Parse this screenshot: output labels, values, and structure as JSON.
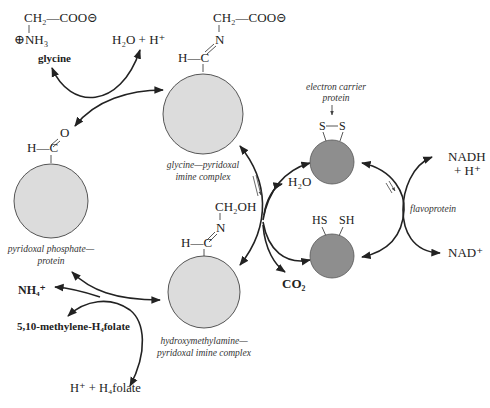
{
  "diagram": {
    "colors": {
      "light_circle": "#dcdcdc",
      "dark_circle": "#8e8e8e",
      "line": "#222222",
      "background": "#ffffff"
    },
    "glycine": {
      "formula_top": "CH₂—COO⊝",
      "formula_bottom": "⊕NH₃",
      "name": "glycine"
    },
    "water_proton": "H₂O + H⁺",
    "glycine_pyridoxal": {
      "formula_top": "CH₂—COO⊝",
      "n": "N",
      "hc": "H—C",
      "label_line1": "glycine—pyridoxal",
      "label_line2": "imine complex"
    },
    "pyridoxal_phosphate": {
      "o": "O",
      "hc": "H—C",
      "label_line1": "pyridoxal phosphate—",
      "label_line2": "protein"
    },
    "hydroxymethylamine": {
      "formula_top": "CH₂OH",
      "n": "N",
      "hc": "H—C",
      "label_line1": "hydroxymethylamine—",
      "label_line2": "pyridoxal imine complex"
    },
    "electron_carrier": {
      "label_line1": "electron carrier",
      "label_line2": "protein",
      "oxidized": "S—S",
      "s_left": "S",
      "s_right": "S",
      "reduced_left": "HS",
      "reduced_right": "SH"
    },
    "products": {
      "h2o": "H₂O",
      "co2": "CO₂",
      "nh4": "NH₄⁺",
      "methylene_folate": "5,10-methylene-H₄folate",
      "h_folate": "H⁺ + H₄folate",
      "nadh_line1": "NADH",
      "nadh_line2": "+ H⁺",
      "nad": "NAD⁺",
      "flavoprotein": "flavoprotein"
    }
  }
}
